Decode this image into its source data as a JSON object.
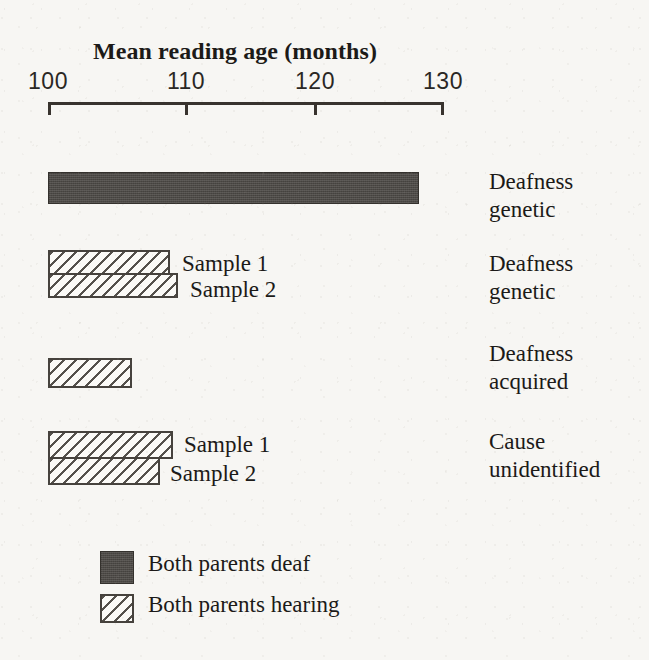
{
  "chart_data": {
    "type": "bar",
    "orientation": "horizontal",
    "title": "Mean reading age (months)",
    "xlabel": "Mean reading age (months)",
    "ylabel": "",
    "xlim": [
      100,
      130
    ],
    "xticks": [
      100,
      110,
      120,
      130
    ],
    "xtick_labels": [
      "100",
      "110",
      "120",
      "130"
    ],
    "grid": false,
    "legend_position": "bottom-left",
    "axis_baseline": 100,
    "units": "months",
    "legend": [
      {
        "label": "Both parents deaf",
        "pattern": "solid",
        "color": "#4d4a46"
      },
      {
        "label": "Both parents hearing",
        "pattern": "diagonal-hatch",
        "color": "#55514c"
      }
    ],
    "groups": [
      {
        "category": "Deafness genetic",
        "category_lines": [
          "Deafness",
          "genetic"
        ],
        "series": "Both parents deaf",
        "bars": [
          {
            "sample_label": "",
            "value": 128.2,
            "pattern": "solid"
          }
        ]
      },
      {
        "category": "Deafness genetic",
        "category_lines": [
          "Deafness",
          "genetic"
        ],
        "series": "Both parents hearing",
        "bars": [
          {
            "sample_label": "Sample 1",
            "value": 109.3,
            "pattern": "diagonal-hatch"
          },
          {
            "sample_label": "Sample 2",
            "value": 109.9,
            "pattern": "diagonal-hatch"
          }
        ]
      },
      {
        "category": "Deafness acquired",
        "category_lines": [
          "Deafness",
          "acquired"
        ],
        "series": "Both parents hearing",
        "bars": [
          {
            "sample_label": "",
            "value": 106.4,
            "pattern": "diagonal-hatch"
          }
        ]
      },
      {
        "category": "Cause unidentified",
        "category_lines": [
          "Cause",
          "unidentified"
        ],
        "series": "Both parents hearing",
        "bars": [
          {
            "sample_label": "Sample 1",
            "value": 109.5,
            "pattern": "diagonal-hatch"
          },
          {
            "sample_label": "Sample 2",
            "value": 108.5,
            "pattern": "diagonal-hatch"
          }
        ]
      }
    ]
  },
  "axis": {
    "title": "Mean reading age (months)",
    "ticks": [
      {
        "label": "100",
        "value": 100
      },
      {
        "label": "110",
        "value": 110
      },
      {
        "label": "120",
        "value": 120
      },
      {
        "label": "130",
        "value": 130
      }
    ]
  },
  "categories": [
    {
      "line1": "Deafness",
      "line2": "genetic"
    },
    {
      "line1": "Deafness",
      "line2": "genetic"
    },
    {
      "line1": "Deafness",
      "line2": "acquired"
    },
    {
      "line1": "Cause",
      "line2": "unidentified"
    }
  ],
  "sample_labels": {
    "group2_sample1": "Sample 1",
    "group2_sample2": "Sample 2",
    "group4_sample1": "Sample 1",
    "group4_sample2": "Sample 2"
  },
  "legend": {
    "deaf_label": "Both parents deaf",
    "hearing_label": "Both parents hearing"
  },
  "colors": {
    "solid_fill": "#4d4a46",
    "hatch_stroke": "#55514c",
    "outline": "#46423d",
    "axis": "#38332e",
    "paper": "#f7f6f3",
    "text": "#1c1a18"
  }
}
